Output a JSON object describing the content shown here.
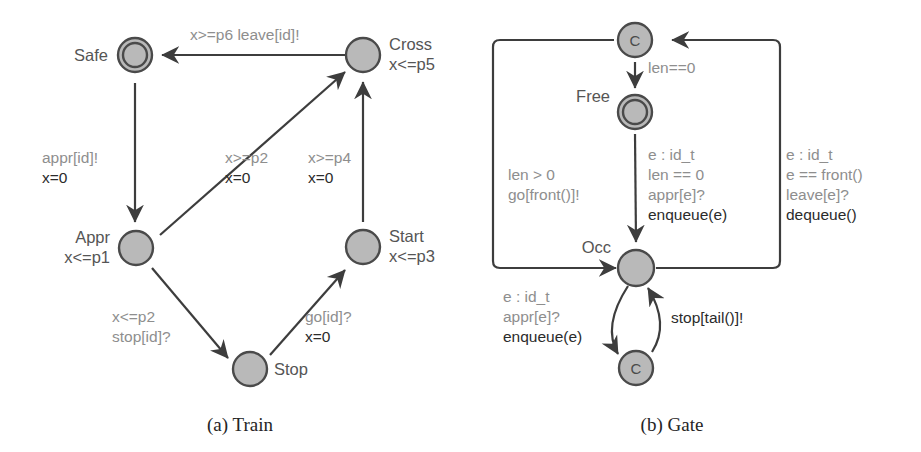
{
  "figure": {
    "background": "#ffffff",
    "node_fill": "#b9b9b9",
    "node_stroke": "#4a4a4a",
    "guard_color": "#8e8e8e",
    "update_color": "#2b2b2b"
  },
  "train": {
    "caption": "(a) Train",
    "nodes": [
      {
        "id": "safe",
        "name": "Safe",
        "invariant": "",
        "inner": "",
        "kind": "initial-double"
      },
      {
        "id": "cross",
        "name": "Cross",
        "invariant": "x<=p5",
        "inner": "",
        "kind": "normal"
      },
      {
        "id": "appr",
        "name": "Appr",
        "invariant": "x<=p1",
        "inner": "",
        "kind": "normal"
      },
      {
        "id": "start",
        "name": "Start",
        "invariant": "x<=p3",
        "inner": "",
        "kind": "normal"
      },
      {
        "id": "stop",
        "name": "Stop",
        "invariant": "",
        "inner": "",
        "kind": "normal"
      }
    ],
    "edges": [
      {
        "id": "cross-safe",
        "from": "Cross",
        "to": "Safe",
        "guard": [
          "x>=p6  leave[id]!"
        ],
        "update": []
      },
      {
        "id": "safe-appr",
        "from": "Safe",
        "to": "Appr",
        "guard": [
          "appr[id]!"
        ],
        "update": [
          "x=0"
        ]
      },
      {
        "id": "appr-cross",
        "from": "Appr",
        "to": "Cross",
        "guard": [
          "x>=p2"
        ],
        "update": [
          "x=0"
        ]
      },
      {
        "id": "start-cross",
        "from": "Start",
        "to": "Cross",
        "guard": [
          "x>=p4"
        ],
        "update": [
          "x=0"
        ]
      },
      {
        "id": "appr-stop",
        "from": "Appr",
        "to": "Stop",
        "guard": [
          "x<=p2",
          "stop[id]?"
        ],
        "update": []
      },
      {
        "id": "stop-start",
        "from": "Stop",
        "to": "Start",
        "guard": [
          "go[id]?"
        ],
        "update": [
          "x=0"
        ]
      }
    ]
  },
  "gate": {
    "caption": "(b) Gate",
    "nodes": [
      {
        "id": "c-top",
        "name": "",
        "invariant": "",
        "inner": "C",
        "kind": "committed"
      },
      {
        "id": "free",
        "name": "Free",
        "invariant": "",
        "inner": "",
        "kind": "initial-double"
      },
      {
        "id": "occ",
        "name": "Occ",
        "invariant": "",
        "inner": "",
        "kind": "normal"
      },
      {
        "id": "c-bottom",
        "name": "",
        "invariant": "",
        "inner": "C",
        "kind": "committed"
      }
    ],
    "edges": [
      {
        "id": "ctop-free",
        "from": "C",
        "to": "Free",
        "guard": [
          "len==0"
        ],
        "update": []
      },
      {
        "id": "occ-ctop",
        "from": "Occ",
        "to": "C",
        "guard": [
          "len > 0",
          "go[front()]!"
        ],
        "update": []
      },
      {
        "id": "free-occ",
        "from": "Free",
        "to": "Occ",
        "guard": [
          "e : id_t",
          "len == 0",
          "appr[e]?"
        ],
        "update": [
          "enqueue(e)"
        ]
      },
      {
        "id": "occ-ctop-r",
        "from": "Occ",
        "to": "C",
        "guard": [
          "e : id_t",
          "e == front()",
          "leave[e]?"
        ],
        "update": [
          "dequeue()"
        ]
      },
      {
        "id": "occ-cbottom",
        "from": "Occ",
        "to": "C",
        "guard": [
          "e : id_t",
          "appr[e]?"
        ],
        "update": [
          "enqueue(e)"
        ]
      },
      {
        "id": "cbottom-occ",
        "from": "C",
        "to": "Occ",
        "guard": [
          "stop[tail()]!"
        ],
        "update": []
      }
    ]
  }
}
